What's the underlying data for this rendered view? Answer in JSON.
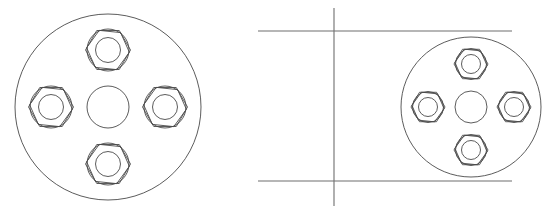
{
  "document": {
    "title": "Flange Face Technical Drawing",
    "view_type": "orthographic-line-drawing",
    "background_color": "#ffffff",
    "canvas": {
      "width": 553,
      "height": 217
    }
  },
  "style": {
    "line_color": "#4a4a4a",
    "construction_line_color": "#6e6e6e",
    "line_width": 0.9,
    "construction_line_width": 1.1,
    "fill": "none"
  },
  "views": [
    {
      "id": "left-flange-view",
      "label": "Flange Front View (Large)",
      "center": {
        "x": 108,
        "y": 107
      },
      "outer_circle": {
        "cx": 108,
        "cy": 107,
        "r": 93
      },
      "hub_circle": {
        "cx": 108,
        "cy": 107,
        "r": 21
      },
      "bolt_circle_radius": 57,
      "bolt_count": 4,
      "bolt_angles_deg": [
        270,
        0,
        90,
        180
      ],
      "bolt": {
        "hex_radius": 22.5,
        "hex_rotation_deg": 0,
        "washer_circle_r": 21,
        "hole_circle_r": 12.5,
        "inner_hole_r": 12.5
      },
      "bolts": [
        {
          "id": "bolt-top",
          "label": "Bolt Top",
          "cx": 108,
          "cy": 50
        },
        {
          "id": "bolt-right",
          "label": "Bolt Right",
          "cx": 165,
          "cy": 107
        },
        {
          "id": "bolt-bottom",
          "label": "Bolt Bottom",
          "cx": 108,
          "cy": 164
        },
        {
          "id": "bolt-left",
          "label": "Bolt Left",
          "cx": 51,
          "cy": 107
        }
      ]
    },
    {
      "id": "right-flange-view",
      "label": "Flange Front View (Small)",
      "center": {
        "x": 471,
        "y": 107
      },
      "outer_circle": {
        "cx": 471,
        "cy": 107,
        "r": 70
      },
      "hub_circle": {
        "cx": 471,
        "cy": 107,
        "r": 16
      },
      "bolt_circle_radius": 43,
      "bolt_count": 4,
      "bolt_angles_deg": [
        270,
        0,
        90,
        180
      ],
      "bolt": {
        "hex_radius": 17,
        "hex_rotation_deg": 0,
        "washer_circle_r": 15.5,
        "hole_circle_r": 9.5,
        "inner_hole_r": 9.5
      },
      "bolts": [
        {
          "id": "bolt-top",
          "label": "Bolt Top",
          "cx": 471,
          "cy": 64
        },
        {
          "id": "bolt-right",
          "label": "Bolt Right",
          "cx": 514,
          "cy": 107
        },
        {
          "id": "bolt-bottom",
          "label": "Bolt Bottom",
          "cx": 471,
          "cy": 150
        },
        {
          "id": "bolt-left",
          "label": "Bolt Left",
          "cx": 428,
          "cy": 107
        }
      ]
    }
  ],
  "construction_lines": [
    {
      "id": "vertical-center-line",
      "label": "Vertical Construction Line",
      "orientation": "vertical",
      "x1": 334,
      "y1": 8,
      "x2": 334,
      "y2": 206
    },
    {
      "id": "horizontal-upper-line",
      "label": "Upper Horizontal Projection Line",
      "orientation": "horizontal",
      "x1": 258,
      "y1": 31,
      "x2": 512,
      "y2": 31
    },
    {
      "id": "horizontal-lower-line",
      "label": "Lower Horizontal Projection Line",
      "orientation": "horizontal",
      "x1": 258,
      "y1": 181,
      "x2": 512,
      "y2": 181
    }
  ]
}
